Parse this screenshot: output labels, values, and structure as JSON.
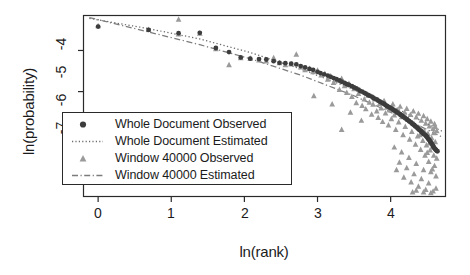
{
  "chart_data": {
    "type": "scatter",
    "title": "",
    "subtitle": "",
    "xlabel": "ln(rank)",
    "ylabel": "ln(probability)",
    "xlim": [
      -0.2,
      4.75
    ],
    "ylim": [
      -7.55,
      -3.15
    ],
    "xticks": [
      0,
      1,
      2,
      3,
      4
    ],
    "xtick_labels": [
      "0",
      "1",
      "2",
      "3",
      "4"
    ],
    "yticks": [
      -4,
      -5,
      -6,
      -7
    ],
    "ytick_labels": [
      "-4",
      "-5",
      "-6",
      "-7"
    ],
    "grid": false,
    "legend_position": "lower-left",
    "legend_entries": [
      {
        "label": "Whole Document Observed",
        "marker": "filled-circle",
        "color": "#3d3d3d",
        "line": "none"
      },
      {
        "label": "Whole Document Estimated",
        "marker": "none",
        "color": "#6b6b6b",
        "line": "dotted"
      },
      {
        "label": "Window 40000 Observed",
        "marker": "filled-triangle",
        "color": "#9a9a9a",
        "line": "none"
      },
      {
        "label": "Window 40000 Estimated",
        "marker": "none",
        "color": "#7c7c7c",
        "line": "dashdot"
      }
    ],
    "series": [
      {
        "name": "Whole Document Observed",
        "type": "scatter",
        "marker": "filled-circle",
        "color": "#3d3d3d",
        "points": [
          [
            0.0,
            -3.42
          ],
          [
            0.69,
            -3.5
          ],
          [
            1.1,
            -3.58
          ],
          [
            1.39,
            -3.57
          ],
          [
            1.61,
            -3.94
          ],
          [
            1.79,
            -4.04
          ],
          [
            1.95,
            -4.17
          ],
          [
            2.08,
            -4.2
          ],
          [
            2.2,
            -4.21
          ],
          [
            2.3,
            -4.22
          ],
          [
            2.4,
            -4.26
          ],
          [
            2.48,
            -4.3
          ],
          [
            2.56,
            -4.31
          ],
          [
            2.64,
            -4.32
          ],
          [
            2.71,
            -4.34
          ],
          [
            2.77,
            -4.38
          ],
          [
            2.83,
            -4.41
          ],
          [
            2.89,
            -4.45
          ],
          [
            2.94,
            -4.47
          ],
          [
            3.0,
            -4.52
          ],
          [
            3.04,
            -4.55
          ],
          [
            3.09,
            -4.58
          ],
          [
            3.14,
            -4.61
          ],
          [
            3.18,
            -4.64
          ],
          [
            3.22,
            -4.67
          ],
          [
            3.26,
            -4.7
          ],
          [
            3.3,
            -4.73
          ],
          [
            3.33,
            -4.76
          ],
          [
            3.37,
            -4.79
          ],
          [
            3.4,
            -4.82
          ],
          [
            3.43,
            -4.84
          ],
          [
            3.47,
            -4.87
          ],
          [
            3.5,
            -4.9
          ],
          [
            3.53,
            -4.92
          ],
          [
            3.56,
            -4.95
          ],
          [
            3.58,
            -4.98
          ],
          [
            3.61,
            -5.0
          ],
          [
            3.64,
            -5.03
          ],
          [
            3.66,
            -5.05
          ],
          [
            3.69,
            -5.08
          ],
          [
            3.71,
            -5.1
          ],
          [
            3.74,
            -5.12
          ],
          [
            3.76,
            -5.15
          ],
          [
            3.78,
            -5.17
          ],
          [
            3.81,
            -5.19
          ],
          [
            3.83,
            -5.22
          ],
          [
            3.85,
            -5.24
          ],
          [
            3.87,
            -5.26
          ],
          [
            3.89,
            -5.28
          ],
          [
            3.91,
            -5.3
          ],
          [
            3.93,
            -5.33
          ],
          [
            3.95,
            -5.35
          ],
          [
            3.97,
            -5.37
          ],
          [
            3.99,
            -5.39
          ],
          [
            4.01,
            -5.41
          ],
          [
            4.03,
            -5.43
          ],
          [
            4.04,
            -5.45
          ],
          [
            4.06,
            -5.47
          ],
          [
            4.08,
            -5.49
          ],
          [
            4.09,
            -5.51
          ],
          [
            4.11,
            -5.53
          ],
          [
            4.13,
            -5.55
          ],
          [
            4.14,
            -5.57
          ],
          [
            4.16,
            -5.59
          ],
          [
            4.17,
            -5.61
          ],
          [
            4.19,
            -5.63
          ],
          [
            4.2,
            -5.65
          ],
          [
            4.22,
            -5.67
          ],
          [
            4.23,
            -5.69
          ],
          [
            4.25,
            -5.71
          ],
          [
            4.26,
            -5.73
          ],
          [
            4.28,
            -5.75
          ],
          [
            4.29,
            -5.77
          ],
          [
            4.3,
            -5.79
          ],
          [
            4.32,
            -5.81
          ],
          [
            4.33,
            -5.83
          ],
          [
            4.34,
            -5.85
          ],
          [
            4.36,
            -5.87
          ],
          [
            4.37,
            -5.89
          ],
          [
            4.38,
            -5.91
          ],
          [
            4.39,
            -5.93
          ],
          [
            4.41,
            -5.95
          ],
          [
            4.42,
            -5.97
          ],
          [
            4.43,
            -5.99
          ],
          [
            4.44,
            -6.01
          ],
          [
            4.45,
            -6.03
          ],
          [
            4.47,
            -6.05
          ],
          [
            4.48,
            -6.07
          ],
          [
            4.49,
            -6.09
          ],
          [
            4.5,
            -6.11
          ],
          [
            4.51,
            -6.14
          ],
          [
            4.52,
            -6.16
          ],
          [
            4.53,
            -6.18
          ],
          [
            4.54,
            -6.21
          ],
          [
            4.55,
            -6.23
          ],
          [
            4.56,
            -6.26
          ],
          [
            4.57,
            -6.29
          ],
          [
            4.58,
            -6.32
          ],
          [
            4.59,
            -6.35
          ],
          [
            4.6,
            -6.38
          ],
          [
            4.61,
            -6.4
          ],
          [
            4.62,
            -6.42
          ],
          [
            4.63,
            -6.44
          ],
          [
            4.64,
            -6.45
          ]
        ]
      },
      {
        "name": "Window 40000 Observed",
        "type": "scatter",
        "marker": "filled-triangle",
        "color": "#9a9a9a",
        "points": [
          [
            0.0,
            -3.4
          ],
          [
            0.69,
            -3.49
          ],
          [
            1.1,
            -3.24
          ],
          [
            1.1,
            -3.6
          ],
          [
            1.39,
            -3.58
          ],
          [
            1.61,
            -3.96
          ],
          [
            1.79,
            -4.35
          ],
          [
            1.95,
            -4.18
          ],
          [
            2.08,
            -4.19
          ],
          [
            2.2,
            -4.23
          ],
          [
            2.3,
            -4.26
          ],
          [
            2.4,
            -4.18
          ],
          [
            2.48,
            -4.3
          ],
          [
            2.56,
            -4.35
          ],
          [
            2.64,
            -4.33
          ],
          [
            2.71,
            -4.09
          ],
          [
            2.77,
            -4.4
          ],
          [
            2.83,
            -4.47
          ],
          [
            2.89,
            -4.44
          ],
          [
            2.94,
            -4.52
          ],
          [
            3.0,
            -4.48
          ],
          [
            3.05,
            -4.6
          ],
          [
            3.1,
            -4.56
          ],
          [
            3.14,
            -4.7
          ],
          [
            3.18,
            -4.62
          ],
          [
            3.22,
            -4.78
          ],
          [
            3.26,
            -4.72
          ],
          [
            3.3,
            -4.95
          ],
          [
            3.33,
            -4.68
          ],
          [
            3.37,
            -4.86
          ],
          [
            3.4,
            -5.02
          ],
          [
            3.43,
            -4.8
          ],
          [
            3.47,
            -5.12
          ],
          [
            3.5,
            -4.93
          ],
          [
            3.53,
            -5.27
          ],
          [
            3.56,
            -5.05
          ],
          [
            3.58,
            -4.99
          ],
          [
            3.61,
            -5.34
          ],
          [
            3.64,
            -5.18
          ],
          [
            3.66,
            -5.42
          ],
          [
            3.69,
            -5.09
          ],
          [
            3.71,
            -5.26
          ],
          [
            3.74,
            -5.55
          ],
          [
            3.76,
            -5.31
          ],
          [
            3.78,
            -5.18
          ],
          [
            3.81,
            -5.47
          ],
          [
            3.83,
            -5.63
          ],
          [
            3.85,
            -5.29
          ],
          [
            3.87,
            -5.4
          ],
          [
            3.89,
            -5.73
          ],
          [
            3.91,
            -5.22
          ],
          [
            3.93,
            -5.52
          ],
          [
            3.95,
            -5.38
          ],
          [
            3.97,
            -5.81
          ],
          [
            3.99,
            -5.45
          ],
          [
            4.01,
            -5.66
          ],
          [
            4.03,
            -5.3
          ],
          [
            4.05,
            -5.57
          ],
          [
            4.07,
            -5.92
          ],
          [
            4.09,
            -5.44
          ],
          [
            4.11,
            -5.74
          ],
          [
            4.13,
            -5.36
          ],
          [
            4.15,
            -5.61
          ],
          [
            4.17,
            -6.05
          ],
          [
            4.19,
            -5.5
          ],
          [
            4.2,
            -5.85
          ],
          [
            4.22,
            -5.41
          ],
          [
            4.24,
            -5.68
          ],
          [
            4.26,
            -6.16
          ],
          [
            4.27,
            -5.56
          ],
          [
            4.29,
            -5.97
          ],
          [
            4.31,
            -5.47
          ],
          [
            4.32,
            -5.78
          ],
          [
            4.34,
            -6.28
          ],
          [
            4.35,
            -5.62
          ],
          [
            4.37,
            -6.08
          ],
          [
            4.38,
            -5.53
          ],
          [
            4.4,
            -5.88
          ],
          [
            4.41,
            -6.41
          ],
          [
            4.42,
            -5.7
          ],
          [
            4.44,
            -6.19
          ],
          [
            4.45,
            -5.59
          ],
          [
            4.46,
            -5.96
          ],
          [
            4.47,
            -6.55
          ],
          [
            4.48,
            -5.77
          ],
          [
            4.49,
            -6.3
          ],
          [
            4.5,
            -5.66
          ],
          [
            4.51,
            -6.02
          ],
          [
            4.52,
            -6.7
          ],
          [
            4.53,
            -5.84
          ],
          [
            4.54,
            -6.42
          ],
          [
            4.55,
            -5.72
          ],
          [
            4.56,
            -6.12
          ],
          [
            4.57,
            -6.88
          ],
          [
            4.58,
            -5.9
          ],
          [
            4.59,
            -6.55
          ],
          [
            4.6,
            -5.78
          ],
          [
            4.61,
            -6.22
          ],
          [
            4.62,
            -7.05
          ],
          [
            4.63,
            -6.62
          ],
          [
            3.33,
            -5.92
          ],
          [
            3.45,
            -5.5
          ],
          [
            3.2,
            -5.3
          ],
          [
            2.95,
            -5.1
          ],
          [
            3.6,
            -5.7
          ],
          [
            4.05,
            -6.35
          ],
          [
            4.15,
            -6.47
          ],
          [
            4.25,
            -6.6
          ],
          [
            4.35,
            -6.75
          ],
          [
            4.45,
            -6.9
          ],
          [
            4.12,
            -6.72
          ],
          [
            4.22,
            -6.85
          ],
          [
            4.32,
            -7.0
          ],
          [
            4.42,
            -7.12
          ],
          [
            4.52,
            -7.22
          ],
          [
            4.18,
            -7.08
          ],
          [
            4.28,
            -7.2
          ],
          [
            4.38,
            -7.3
          ],
          [
            4.48,
            -7.38
          ],
          [
            4.58,
            -7.42
          ],
          [
            4.35,
            -7.4
          ],
          [
            4.45,
            -7.44
          ],
          [
            4.55,
            -7.46
          ],
          [
            4.62,
            -7.35
          ],
          [
            4.3,
            -7.44
          ],
          [
            4.08,
            -6.9
          ],
          [
            4.55,
            -6.95
          ],
          [
            4.6,
            -6.8
          ],
          [
            4.5,
            -6.48
          ],
          [
            4.4,
            -6.05
          ],
          [
            4.63,
            -5.95
          ],
          [
            4.61,
            -5.85
          ],
          [
            4.59,
            -6.0
          ],
          [
            4.57,
            -6.35
          ],
          [
            4.53,
            -6.25
          ]
        ]
      }
    ],
    "fit_lines": [
      {
        "name": "Whole Document Estimated",
        "style": "dotted",
        "color": "#6b6b6b",
        "points": [
          [
            -0.12,
            -3.22
          ],
          [
            0.69,
            -3.47
          ],
          [
            1.39,
            -3.72
          ],
          [
            2.08,
            -4.05
          ],
          [
            2.77,
            -4.45
          ],
          [
            3.47,
            -4.93
          ],
          [
            4.16,
            -5.48
          ],
          [
            4.7,
            -5.96
          ]
        ]
      },
      {
        "name": "Window 40000 Estimated",
        "style": "dashdot",
        "color": "#7c7c7c",
        "points": [
          [
            -0.12,
            -3.2
          ],
          [
            0.69,
            -3.55
          ],
          [
            1.39,
            -3.86
          ],
          [
            2.08,
            -4.2
          ],
          [
            2.77,
            -4.6
          ],
          [
            3.47,
            -5.08
          ],
          [
            4.16,
            -5.63
          ],
          [
            4.7,
            -6.1
          ]
        ]
      }
    ]
  },
  "axes": {
    "ylabel_text": "ln(probability)",
    "xlabel_text": "ln(rank)",
    "ytick_labels": [
      "-4",
      "-5",
      "-6",
      "-7"
    ],
    "xtick_labels": [
      "0",
      "1",
      "2",
      "3",
      "4"
    ]
  },
  "legend": {
    "entries": [
      "Whole Document Observed",
      "Whole Document Estimated",
      "Window 40000 Observed",
      "Window 40000 Estimated"
    ]
  },
  "colors": {
    "axis": "#2a2a2a",
    "text": "#1b1b1b",
    "circle_marker": "#3d3d3d",
    "triangle_marker": "#9a9a9a",
    "dotted_line": "#6b6b6b",
    "dashdot_line": "#7c7c7c",
    "background": "#ffffff"
  }
}
